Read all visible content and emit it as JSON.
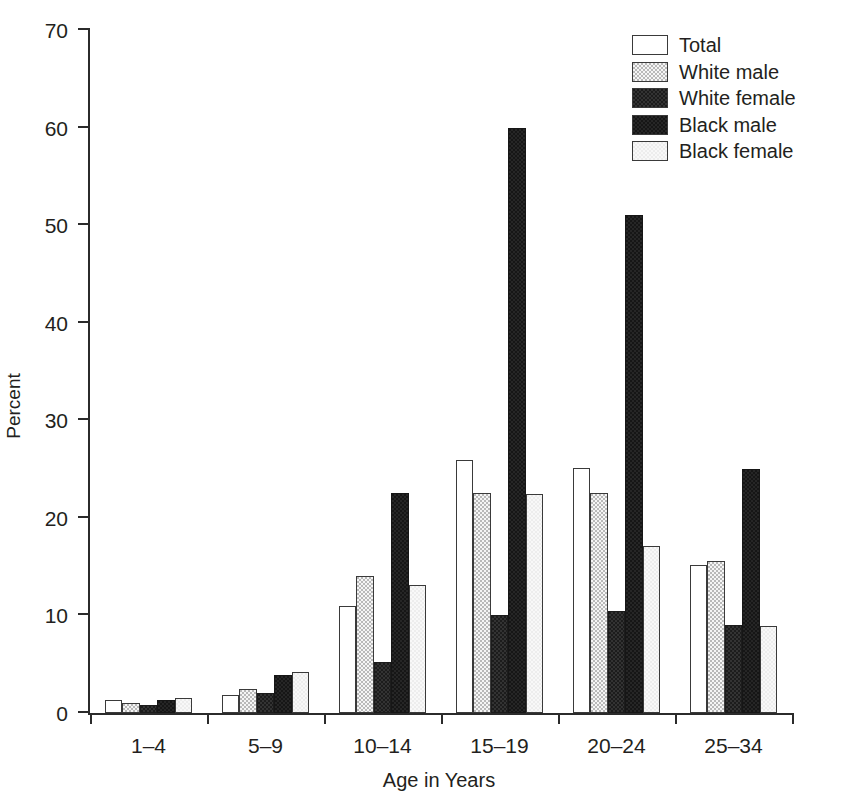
{
  "chart_data": {
    "type": "bar",
    "title": "",
    "xlabel": "Age in Years",
    "ylabel": "Percent",
    "ylim": [
      0,
      70
    ],
    "yticks": [
      0,
      10,
      20,
      30,
      40,
      50,
      60,
      70
    ],
    "grid": false,
    "legend_position": "top-right",
    "categories": [
      "1–4",
      "5–9",
      "10–14",
      "15–19",
      "20–24",
      "25–34"
    ],
    "series": [
      {
        "name": "Total",
        "values": [
          1.3,
          1.8,
          11.0,
          25.9,
          25.1,
          15.2
        ]
      },
      {
        "name": "White male",
        "values": [
          1.0,
          2.5,
          14.0,
          22.5,
          22.5,
          15.6
        ]
      },
      {
        "name": "White female",
        "values": [
          0.8,
          2.1,
          5.2,
          10.0,
          10.5,
          9.0
        ]
      },
      {
        "name": "Black male",
        "values": [
          1.3,
          3.9,
          22.5,
          60.0,
          51.0,
          25.0
        ]
      },
      {
        "name": "Black female",
        "values": [
          1.5,
          4.2,
          13.1,
          22.4,
          17.1,
          8.9
        ]
      }
    ],
    "series_colors": [
      "#ffffff",
      "#b9b9b9",
      "#1c1c1c",
      "#161616",
      "#ededed"
    ]
  },
  "legend": {
    "items": [
      {
        "label": "Total",
        "swatch": "swatch-total"
      },
      {
        "label": "White male",
        "swatch": "swatch-white-male"
      },
      {
        "label": "White female",
        "swatch": "swatch-white-female"
      },
      {
        "label": "Black male",
        "swatch": "swatch-black-male"
      },
      {
        "label": "Black female",
        "swatch": "swatch-black-female"
      }
    ]
  },
  "axes": {
    "y_title": "Percent",
    "x_title": "Age in Years",
    "y_tick_labels": [
      "0",
      "10",
      "20",
      "30",
      "40",
      "50",
      "60",
      "70"
    ],
    "x_tick_labels": [
      "1–4",
      "5–9",
      "10–14",
      "15–19",
      "20–24",
      "25–34"
    ]
  }
}
